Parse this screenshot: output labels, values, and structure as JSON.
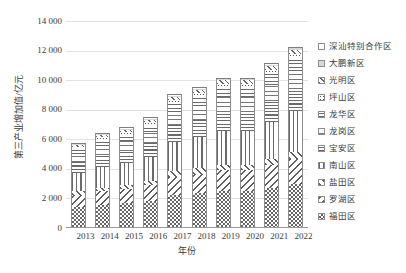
{
  "chart_data": {
    "type": "bar",
    "stacked": true,
    "title": "",
    "xlabel": "年份",
    "ylabel": "第三产业增加值/亿元",
    "ylim": [
      0,
      14000
    ],
    "yticks": [
      "0",
      "2 000",
      "4 000",
      "6 000",
      "8 000",
      "10 000",
      "12 000",
      "14 000"
    ],
    "ytick_values": [
      0,
      2000,
      4000,
      6000,
      8000,
      10000,
      12000,
      14000
    ],
    "grid": true,
    "legend_position": "right",
    "categories": [
      "2013",
      "2014",
      "2015",
      "2016",
      "2017",
      "2018",
      "2019",
      "2020",
      "2021",
      "2022"
    ],
    "series": [
      {
        "name": "福田区",
        "pattern": "checker",
        "values": [
          1430,
          1590,
          1700,
          1860,
          2230,
          2350,
          2500,
          2500,
          2740,
          3010
        ]
      },
      {
        "name": "罗湖区",
        "pattern": "diag-back",
        "values": [
          820,
          900,
          950,
          1030,
          1250,
          1310,
          1400,
          1400,
          1530,
          1680
        ]
      },
      {
        "name": "盐田区",
        "pattern": "diag-fwd",
        "values": [
          230,
          250,
          265,
          290,
          350,
          370,
          395,
          395,
          430,
          470
        ]
      },
      {
        "name": "南山区",
        "pattern": "vert",
        "values": [
          1260,
          1420,
          1490,
          1650,
          2010,
          2120,
          2270,
          2270,
          2490,
          2740
        ]
      },
      {
        "name": "宝安区",
        "pattern": "horz",
        "values": [
          700,
          790,
          830,
          920,
          1120,
          1180,
          1260,
          1260,
          1380,
          1520
        ]
      },
      {
        "name": "龙岗区",
        "pattern": "horz-wide",
        "values": [
          560,
          630,
          665,
          735,
          890,
          940,
          1010,
          1010,
          1110,
          1220
        ]
      },
      {
        "name": "龙华区",
        "pattern": "grid",
        "values": [
          380,
          430,
          455,
          500,
          610,
          640,
          690,
          690,
          755,
          830
        ]
      },
      {
        "name": "坪山区",
        "pattern": "dots",
        "values": [
          130,
          150,
          155,
          175,
          210,
          220,
          235,
          235,
          260,
          285
        ]
      },
      {
        "name": "光明区",
        "pattern": "cross-diag",
        "values": [
          120,
          135,
          145,
          160,
          195,
          205,
          220,
          220,
          240,
          265
        ]
      },
      {
        "name": "大鹏新区",
        "pattern": "solid-light",
        "values": [
          60,
          70,
          72,
          80,
          95,
          100,
          108,
          108,
          118,
          130
        ]
      },
      {
        "name": "深汕特别合作区",
        "pattern": "white",
        "values": [
          10,
          12,
          13,
          15,
          18,
          20,
          22,
          22,
          25,
          28
        ]
      }
    ],
    "totals": [
      5700,
      6377,
      6740,
      7415,
      8978,
      9455,
      10110,
      10110,
      11078,
      12178
    ]
  },
  "legend": {
    "items": [
      {
        "label": "深汕特别合作区",
        "pattern": "white"
      },
      {
        "label": "大鹏新区",
        "pattern": "solid-light"
      },
      {
        "label": "光明区",
        "pattern": "cross-diag"
      },
      {
        "label": "坪山区",
        "pattern": "dots"
      },
      {
        "label": "龙华区",
        "pattern": "grid"
      },
      {
        "label": "龙岗区",
        "pattern": "horz-wide"
      },
      {
        "label": "宝安区",
        "pattern": "horz"
      },
      {
        "label": "南山区",
        "pattern": "vert"
      },
      {
        "label": "盐田区",
        "pattern": "diag-fwd"
      },
      {
        "label": "罗湖区",
        "pattern": "diag-back"
      },
      {
        "label": "福田区",
        "pattern": "checker"
      }
    ]
  }
}
